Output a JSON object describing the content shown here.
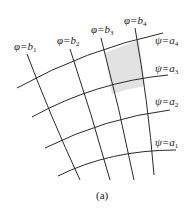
{
  "diagram": {
    "caption": "(a)",
    "phi_lines": [
      {
        "label_var": "φ=b",
        "label_sub": "1"
      },
      {
        "label_var": "φ=b",
        "label_sub": "2"
      },
      {
        "label_var": "φ=b",
        "label_sub": "3"
      },
      {
        "label_var": "φ=b",
        "label_sub": "4"
      }
    ],
    "psi_lines": [
      {
        "label_var": "ψ=a",
        "label_sub": "4"
      },
      {
        "label_var": "ψ=a",
        "label_sub": "3"
      },
      {
        "label_var": "ψ=a",
        "label_sub": "2"
      },
      {
        "label_var": "ψ=a",
        "label_sub": "1"
      }
    ],
    "shaded_cell": "between φ=b3, φ=b4, ψ=a3, ψ=a4",
    "colors": {
      "line": "#2a2a2a",
      "shade": "#d8d8d8"
    }
  }
}
